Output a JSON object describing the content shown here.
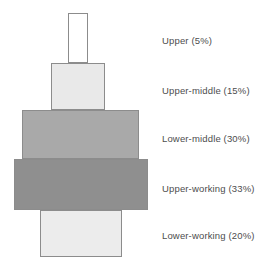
{
  "figure": {
    "background_color": "#ffffff",
    "outline_color": "#8c8c8c"
  },
  "chart_data": {
    "type": "bar",
    "title": "",
    "subtitle": "",
    "xlabel": "",
    "ylabel": "",
    "orientation": "stacked-vertical-centered",
    "legend_position": "right",
    "grid": false,
    "categories": [
      "Upper",
      "Upper-middle",
      "Lower-middle",
      "Upper-working",
      "Lower-working"
    ],
    "values": [
      5,
      15,
      30,
      33,
      20
    ],
    "value_unit": "%",
    "series": [
      {
        "name": "Share of population",
        "values": [
          5,
          15,
          30,
          33,
          20
        ]
      }
    ],
    "annotations": [
      "Upper (5%)",
      "Upper-middle (15%)",
      "Lower-middle (30%)",
      "Upper-working (33%)",
      "Lower-working (20%)"
    ]
  },
  "bands": [
    {
      "key": "upper",
      "name": "Upper",
      "percent": 5,
      "label": "Upper (5%)",
      "fill": "#ffffff",
      "x": 68,
      "y": 13,
      "width": 20,
      "height": 50,
      "label_y": 35
    },
    {
      "key": "upper-middle",
      "name": "Upper-middle",
      "percent": 15,
      "label": "Upper-middle (15%)",
      "fill": "#e9e9e9",
      "x": 51,
      "y": 63,
      "width": 54,
      "height": 47,
      "label_y": 85
    },
    {
      "key": "lower-middle",
      "name": "Lower-middle",
      "percent": 30,
      "label": "Lower-middle (30%)",
      "fill": "#a9a9a9",
      "x": 22,
      "y": 110,
      "width": 117,
      "height": 49,
      "label_y": 133
    },
    {
      "key": "upper-working",
      "name": "Upper-working",
      "percent": 33,
      "label": "Upper-working (33%)",
      "fill": "#8f8f8f",
      "x": 14,
      "y": 159,
      "width": 134,
      "height": 51,
      "label_y": 183
    },
    {
      "key": "lower-working",
      "name": "Lower-working",
      "percent": 20,
      "label": "Lower-working (20%)",
      "fill": "#ececec",
      "x": 40,
      "y": 210,
      "width": 82,
      "height": 47,
      "label_y": 230
    }
  ]
}
